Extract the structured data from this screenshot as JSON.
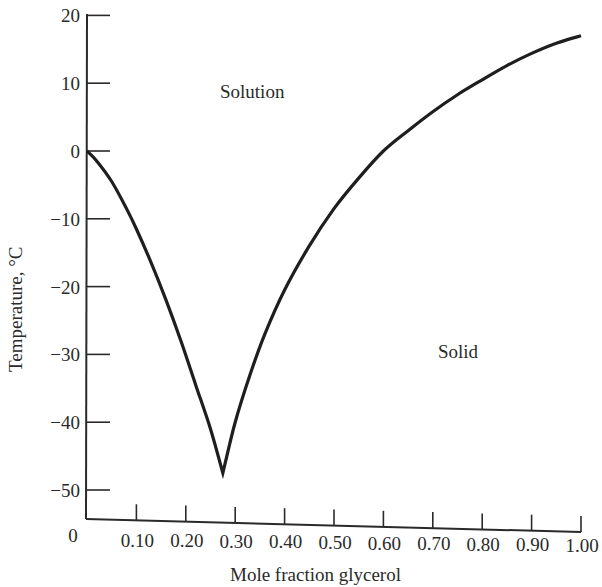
{
  "chart_data": {
    "type": "line",
    "title": "",
    "xlabel": "Mole fraction glycerol",
    "ylabel": "Temperature, °C",
    "xlim": [
      0,
      1.0
    ],
    "ylim": [
      -55,
      20
    ],
    "grid": false,
    "legend": null,
    "x_tick_labels": [
      "0",
      "0.10",
      "0.20",
      "0.30",
      "0.40",
      "0.50",
      "0.60",
      "0.70",
      "0.80",
      "0.90",
      "1.00"
    ],
    "y_tick_labels": [
      "20",
      "10",
      "0",
      "−10",
      "−20",
      "−30",
      "−40",
      "−50"
    ],
    "annotations": [
      {
        "text": "Solution",
        "x": 0.35,
        "y": 8.5
      },
      {
        "text": "Solid",
        "x": 0.78,
        "y": -31
      }
    ],
    "series": [
      {
        "name": "freezing point curve",
        "x": [
          0.0,
          0.02,
          0.05,
          0.08,
          0.1,
          0.13,
          0.16,
          0.19,
          0.22,
          0.25,
          0.275,
          0.3,
          0.33,
          0.36,
          0.4,
          0.45,
          0.5,
          0.55,
          0.6,
          0.65,
          0.7,
          0.75,
          0.8,
          0.85,
          0.9,
          0.95,
          1.0
        ],
        "values": [
          0.0,
          -1.5,
          -4.5,
          -8.5,
          -11.5,
          -16.5,
          -22.0,
          -28.0,
          -34.5,
          -41.0,
          -47.5,
          -40.0,
          -33.0,
          -27.0,
          -20.5,
          -14.0,
          -8.5,
          -4.0,
          0.0,
          3.0,
          5.8,
          8.3,
          10.5,
          12.6,
          14.4,
          15.9,
          17.0
        ]
      }
    ],
    "eutectic": {
      "x": 0.275,
      "y": -47.5
    }
  },
  "axes": {
    "x_title": "Mole fraction glycerol",
    "y_title": "Temperature, °C"
  }
}
